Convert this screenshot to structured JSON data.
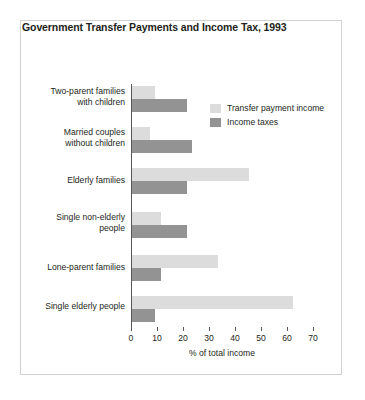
{
  "chart_data": {
    "type": "bar",
    "orientation": "horizontal",
    "title": "Government Transfer Payments and Income Tax, 1993",
    "xlabel": "% of total income",
    "ylabel": "",
    "xlim": [
      0,
      70
    ],
    "xticks": [
      0,
      10,
      20,
      30,
      40,
      50,
      60,
      70
    ],
    "grid": false,
    "legend_position": "top-right",
    "categories": [
      "Two-parent families with children",
      "Married couples without children",
      "Elderly families",
      "Single non-elderly people",
      "Lone-parent families",
      "Single elderly people"
    ],
    "category_lines": [
      [
        "Two-parent families",
        "with children"
      ],
      [
        "Married couples",
        "without children"
      ],
      [
        "Elderly families"
      ],
      [
        "Single non-elderly",
        "people"
      ],
      [
        "Lone-parent families"
      ],
      [
        "Single elderly people"
      ]
    ],
    "series": [
      {
        "name": "Transfer payment income",
        "color": "#dcdcdc",
        "values": [
          9,
          7,
          45,
          11,
          33,
          62
        ]
      },
      {
        "name": "Income taxes",
        "color": "#939393",
        "values": [
          21,
          23,
          21,
          21,
          11,
          9
        ]
      }
    ]
  },
  "colors": {
    "transfer": "#dcdcdc",
    "tax": "#939393",
    "axis": "#58585b",
    "text": "#231f20",
    "frame": "#d2d2d2"
  }
}
